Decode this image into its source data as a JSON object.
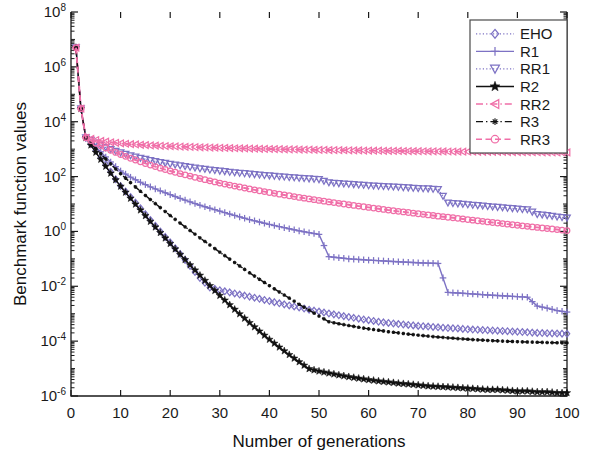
{
  "chart_data": {
    "type": "line",
    "title": "",
    "xlabel": "Number of generations",
    "ylabel": "Benchmark function values",
    "xlim": [
      0,
      100
    ],
    "ylim": [
      1e-06,
      100000000.0
    ],
    "yscale": "log",
    "grid": false,
    "legend_position": "upper right",
    "xticks": [
      0,
      10,
      20,
      30,
      40,
      50,
      60,
      70,
      80,
      90,
      100
    ],
    "xticklabels": [
      "0",
      "10",
      "20",
      "30",
      "40",
      "50",
      "60",
      "70",
      "80",
      "90",
      "100"
    ],
    "yticks": [
      1e-06,
      0.0001,
      0.01,
      1,
      100,
      10000,
      1000000,
      100000000
    ],
    "yticklabels": [
      "10-6",
      "10-4",
      "10-2",
      "100",
      "102",
      "104",
      "106",
      "108"
    ],
    "ytick_mantissa": "10",
    "ytick_exponents": [
      "-6",
      "-4",
      "-2",
      "0",
      "2",
      "4",
      "6",
      "8"
    ],
    "x": [
      1,
      2,
      3,
      4,
      5,
      6,
      7,
      8,
      9,
      10,
      12,
      14,
      16,
      18,
      20,
      22,
      24,
      26,
      28,
      30,
      32,
      34,
      36,
      38,
      40,
      42,
      44,
      46,
      48,
      50,
      52,
      54,
      56,
      58,
      60,
      62,
      64,
      66,
      68,
      70,
      72,
      74,
      76,
      78,
      80,
      82,
      84,
      86,
      88,
      90,
      92,
      94,
      96,
      98,
      100
    ],
    "series": [
      {
        "name": "EHO",
        "color": "#7d72c4",
        "marker": "diamond",
        "linestyle": "dotted",
        "values": [
          5000000.0,
          30000.0,
          2600,
          1500,
          900,
          500,
          280,
          150,
          80,
          45,
          18,
          7.0,
          2.6,
          1.0,
          0.4,
          0.15,
          0.055,
          0.02,
          0.009,
          0.0072,
          0.006,
          0.005,
          0.0042,
          0.0035,
          0.0029,
          0.0024,
          0.002,
          0.0017,
          0.0014,
          0.0012,
          0.00102,
          0.00088,
          0.00076,
          0.00066,
          0.00058,
          0.00051,
          0.00046,
          0.00042,
          0.00039,
          0.00036,
          0.00034,
          0.00032,
          0.0003,
          0.00029,
          0.00027,
          0.00026,
          0.00025,
          0.00024,
          0.00023,
          0.00022,
          0.00021,
          0.0002,
          0.000195,
          0.00019,
          0.000185
        ]
      },
      {
        "name": "R1",
        "color": "#7d72c4",
        "marker": "plus",
        "linestyle": "solid",
        "values": [
          5000000.0,
          30000.0,
          2600,
          1800,
          1200,
          800,
          520,
          340,
          230,
          160,
          95,
          62,
          42,
          30,
          22,
          16,
          12,
          9.0,
          7.0,
          5.5,
          4.3,
          3.4,
          2.7,
          2.2,
          1.8,
          1.5,
          1.25,
          1.05,
          0.9,
          0.78,
          0.12,
          0.11,
          0.1,
          0.095,
          0.09,
          0.086,
          0.082,
          0.078,
          0.075,
          0.072,
          0.07,
          0.068,
          0.006,
          0.0057,
          0.0054,
          0.0051,
          0.0048,
          0.0046,
          0.0044,
          0.0042,
          0.004,
          0.0019,
          0.0016,
          0.0013,
          0.00115
        ]
      },
      {
        "name": "RR1",
        "color": "#7d72c4",
        "marker": "triangle-down",
        "linestyle": "dotted",
        "values": [
          5000000.0,
          30000.0,
          2600,
          2100,
          1700,
          1400,
          1150,
          980,
          850,
          740,
          580,
          470,
          390,
          330,
          285,
          250,
          220,
          196,
          176,
          160,
          146,
          134,
          124,
          115,
          107,
          100,
          94,
          88,
          83,
          78,
          60,
          56,
          53,
          50,
          47,
          45,
          43,
          41,
          39,
          37,
          36,
          34,
          11,
          10.2,
          9.5,
          8.8,
          8.2,
          7.6,
          7.1,
          6.6,
          6.2,
          4.2,
          3.8,
          3.4,
          3.1
        ]
      },
      {
        "name": "R2",
        "color": "#111111",
        "marker": "star",
        "linestyle": "solid",
        "values": [
          5000000.0,
          30000.0,
          2600,
          1400,
          760,
          420,
          235,
          132,
          76,
          44,
          16,
          6.0,
          2.3,
          0.9,
          0.36,
          0.145,
          0.06,
          0.025,
          0.0105,
          0.0046,
          0.0021,
          0.00098,
          0.00047,
          0.00023,
          0.000115,
          6e-05,
          3.2e-05,
          1.75e-05,
          9.8e-06,
          8e-06,
          6.8e-06,
          5.8e-06,
          5e-06,
          4.4e-06,
          3.9e-06,
          3.5e-06,
          3.2e-06,
          2.9e-06,
          2.7e-06,
          2.5e-06,
          2.3e-06,
          2.2e-06,
          2.1e-06,
          2e-06,
          1.9e-06,
          1.8e-06,
          1.7e-06,
          1.7e-06,
          1.6e-06,
          1.5e-06,
          1.5e-06,
          1.4e-06,
          1.4e-06,
          1.3e-06,
          1.3e-06
        ]
      },
      {
        "name": "RR2",
        "color": "#f06fa8",
        "marker": "triangle-left",
        "linestyle": "dashdot",
        "values": [
          5000000.0,
          30000.0,
          2600,
          2350,
          2150,
          2000,
          1880,
          1780,
          1700,
          1630,
          1520,
          1440,
          1370,
          1320,
          1275,
          1235,
          1200,
          1170,
          1140,
          1115,
          1090,
          1068,
          1048,
          1030,
          1012,
          996,
          980,
          966,
          952,
          940,
          928,
          916,
          905,
          895,
          885,
          876,
          867,
          858,
          850,
          842,
          835,
          828,
          821,
          814,
          808,
          802,
          796,
          790,
          785,
          780,
          775,
          770,
          765,
          760,
          756
        ]
      },
      {
        "name": "R3",
        "color": "#111111",
        "marker": "asterisk",
        "linestyle": "dashdot",
        "values": [
          5000000.0,
          30000.0,
          2600,
          1650,
          1050,
          680,
          440,
          290,
          190,
          128,
          60,
          29,
          14.5,
          7.4,
          3.8,
          2.0,
          1.08,
          0.58,
          0.32,
          0.175,
          0.098,
          0.055,
          0.031,
          0.018,
          0.0105,
          0.0062,
          0.0037,
          0.0022,
          0.00135,
          0.00082,
          0.00051,
          0.00043,
          0.00037,
          0.00032,
          0.00028,
          0.00025,
          0.00022,
          0.0002,
          0.00018,
          0.000165,
          0.000152,
          0.000141,
          0.000132,
          0.000124,
          0.000117,
          0.000111,
          0.000106,
          0.000102,
          9.85e-05,
          9.55e-05,
          9.3e-05,
          9.08e-05,
          8.9e-05,
          8.74e-05,
          8.6e-05
        ]
      },
      {
        "name": "RR3",
        "color": "#f06fa8",
        "marker": "circle",
        "linestyle": "dashed",
        "values": [
          5000000.0,
          30000.0,
          2600,
          2050,
          1650,
          1340,
          1100,
          910,
          760,
          640,
          465,
          345,
          262,
          203,
          160,
          128,
          104,
          85,
          70,
          58,
          49,
          41.5,
          35.5,
          30.5,
          26.3,
          22.8,
          19.9,
          17.4,
          15.3,
          13.5,
          11.9,
          10.6,
          9.4,
          8.4,
          7.5,
          6.7,
          6.0,
          5.4,
          4.9,
          4.4,
          4.0,
          3.6,
          3.3,
          3.0,
          2.7,
          2.45,
          2.22,
          2.02,
          1.84,
          1.68,
          1.53,
          1.4,
          1.28,
          1.17,
          1.07
        ]
      }
    ],
    "legend_entries": [
      {
        "label": "EHO",
        "color": "#7d72c4",
        "marker": "diamond",
        "linestyle": "dotted"
      },
      {
        "label": "R1",
        "color": "#7d72c4",
        "marker": "plus",
        "linestyle": "solid"
      },
      {
        "label": "RR1",
        "color": "#7d72c4",
        "marker": "triangle-down",
        "linestyle": "dotted"
      },
      {
        "label": "R2",
        "color": "#111111",
        "marker": "star",
        "linestyle": "solid"
      },
      {
        "label": "RR2",
        "color": "#f06fa8",
        "marker": "triangle-left",
        "linestyle": "dashdot"
      },
      {
        "label": "R3",
        "color": "#111111",
        "marker": "asterisk",
        "linestyle": "dashdot"
      },
      {
        "label": "RR3",
        "color": "#f06fa8",
        "marker": "circle",
        "linestyle": "dashed"
      }
    ]
  }
}
